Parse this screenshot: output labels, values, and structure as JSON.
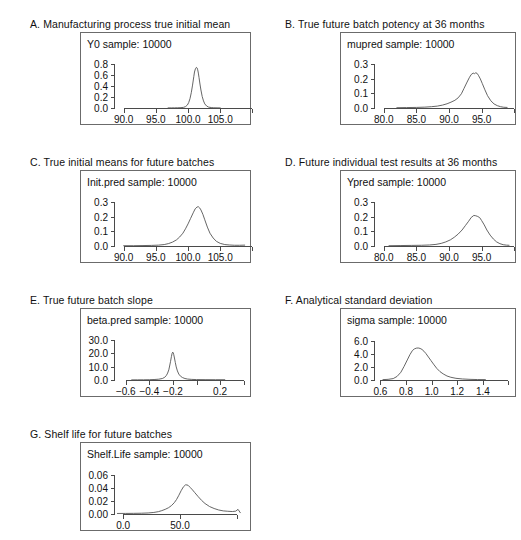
{
  "figure": {
    "background": "#ffffff",
    "line_color": "#555555",
    "frame_color": "#6b6b6b",
    "text_color": "#111111"
  },
  "panels": [
    {
      "id": "A",
      "title": "A. Manufacturing process true initial mean",
      "sample_label": "Y0 sample: 10000",
      "chart_data": {
        "type": "line",
        "title": "Y0 sample: 10000",
        "xlabel": "",
        "ylabel": "",
        "grid": false,
        "legend": "none",
        "xlim": [
          88.5,
          109.0
        ],
        "ylim": [
          0.0,
          0.88
        ],
        "xticks": [
          90.0,
          95.0,
          100.0,
          105.0
        ],
        "xticklabels": [
          "90.0",
          "95.0",
          "100.0",
          "105.0"
        ],
        "extra_xticks": [
          110.0
        ],
        "yticks": [
          0.0,
          0.2,
          0.4,
          0.6,
          0.8
        ],
        "yticklabels": [
          "0.0",
          "0.2",
          "0.4",
          "0.6",
          "0.8"
        ],
        "x": [
          96.9,
          97.4,
          97.9,
          98.4,
          98.9,
          99.3,
          99.6,
          99.9,
          100.1,
          100.3,
          100.5,
          100.7,
          100.9,
          101.0,
          101.15,
          101.3,
          101.4,
          101.5,
          101.6,
          101.7,
          101.85,
          102.0,
          102.2,
          102.4,
          102.6,
          102.9,
          103.2,
          103.6,
          104.0,
          104.5,
          105.0
        ],
        "y": [
          0.002,
          0.002,
          0.003,
          0.004,
          0.006,
          0.012,
          0.025,
          0.055,
          0.1,
          0.17,
          0.28,
          0.42,
          0.58,
          0.66,
          0.72,
          0.745,
          0.735,
          0.7,
          0.64,
          0.56,
          0.44,
          0.33,
          0.21,
          0.13,
          0.075,
          0.035,
          0.016,
          0.008,
          0.004,
          0.003,
          0.002
        ]
      }
    },
    {
      "id": "B",
      "title": "B. True future batch potency at 36 months",
      "sample_label": "mupred sample: 10000",
      "chart_data": {
        "type": "line",
        "title": "mupred sample: 10000",
        "xlabel": "",
        "ylabel": "",
        "grid": false,
        "legend": "none",
        "xlim": [
          78.5,
          99.5
        ],
        "ylim": [
          0.0,
          0.33
        ],
        "xticks": [
          80.0,
          85.0,
          90.0,
          95.0
        ],
        "xticklabels": [
          "80.0",
          "85.0",
          "90.0",
          "95.0"
        ],
        "extra_xticks": [
          100.0
        ],
        "yticks": [
          0.0,
          0.1,
          0.2,
          0.3
        ],
        "yticklabels": [
          "0.0",
          "0.1",
          "0.2",
          "0.3"
        ],
        "x": [
          82.0,
          83.5,
          85.0,
          86.3,
          87.3,
          88.2,
          89.0,
          89.7,
          90.3,
          90.9,
          91.4,
          91.9,
          92.3,
          92.7,
          93.1,
          93.4,
          93.7,
          93.9,
          94.1,
          94.3,
          94.5,
          94.8,
          95.1,
          95.5,
          95.9,
          96.4,
          96.9,
          97.4,
          97.9,
          98.4,
          98.9
        ],
        "y": [
          0.002,
          0.003,
          0.004,
          0.006,
          0.009,
          0.013,
          0.02,
          0.029,
          0.04,
          0.053,
          0.07,
          0.098,
          0.135,
          0.172,
          0.208,
          0.23,
          0.24,
          0.236,
          0.242,
          0.238,
          0.225,
          0.2,
          0.168,
          0.125,
          0.085,
          0.05,
          0.028,
          0.016,
          0.009,
          0.005,
          0.004
        ]
      }
    },
    {
      "id": "C",
      "title": "C. True initial means for future batches",
      "sample_label": "Init.pred sample: 10000",
      "chart_data": {
        "type": "line",
        "title": "Init.pred sample: 10000",
        "xlabel": "",
        "ylabel": "",
        "grid": false,
        "legend": "none",
        "xlim": [
          88.5,
          109.0
        ],
        "ylim": [
          0.0,
          0.33
        ],
        "xticks": [
          90.0,
          95.0,
          100.0,
          105.0
        ],
        "xticklabels": [
          "90.0",
          "95.0",
          "100.0",
          "105.0"
        ],
        "extra_xticks": [
          110.0
        ],
        "yticks": [
          0.0,
          0.1,
          0.2,
          0.3
        ],
        "yticklabels": [
          "0.0",
          "0.1",
          "0.2",
          "0.3"
        ],
        "x": [
          90.0,
          91.5,
          93.0,
          94.3,
          95.4,
          96.3,
          97.0,
          97.6,
          98.2,
          98.7,
          99.2,
          99.6,
          100.0,
          100.4,
          100.8,
          101.1,
          101.4,
          101.6,
          101.8,
          102.0,
          102.3,
          102.6,
          103.0,
          103.4,
          103.9,
          104.4,
          105.0,
          105.7,
          106.4,
          107.2,
          108.0,
          108.8
        ],
        "y": [
          0.002,
          0.002,
          0.003,
          0.004,
          0.006,
          0.01,
          0.017,
          0.027,
          0.042,
          0.062,
          0.088,
          0.118,
          0.152,
          0.19,
          0.228,
          0.255,
          0.268,
          0.27,
          0.262,
          0.248,
          0.218,
          0.18,
          0.13,
          0.088,
          0.055,
          0.032,
          0.018,
          0.01,
          0.007,
          0.005,
          0.005,
          0.006
        ]
      }
    },
    {
      "id": "D",
      "title": "D. Future individual test results at 36 months",
      "sample_label": "Ypred sample: 10000",
      "chart_data": {
        "type": "line",
        "title": "Ypred sample: 10000",
        "xlabel": "",
        "ylabel": "",
        "grid": false,
        "legend": "none",
        "xlim": [
          78.5,
          99.5
        ],
        "ylim": [
          0.0,
          0.33
        ],
        "xticks": [
          80.0,
          85.0,
          90.0,
          95.0
        ],
        "xticklabels": [
          "80.0",
          "85.0",
          "90.0",
          "95.0"
        ],
        "extra_xticks": [
          100.0
        ],
        "yticks": [
          0.0,
          0.1,
          0.2,
          0.3
        ],
        "yticklabels": [
          "0.0",
          "0.1",
          "0.2",
          "0.3"
        ],
        "x": [
          80.8,
          82.5,
          84.2,
          85.8,
          87.0,
          88.0,
          88.8,
          89.5,
          90.2,
          90.8,
          91.4,
          92.0,
          92.5,
          93.0,
          93.4,
          93.8,
          94.1,
          94.4,
          94.7,
          95.0,
          95.4,
          95.8,
          96.3,
          96.8,
          97.3,
          97.8,
          98.3,
          98.8,
          99.2
        ],
        "y": [
          0.002,
          0.003,
          0.004,
          0.005,
          0.007,
          0.011,
          0.018,
          0.028,
          0.042,
          0.06,
          0.082,
          0.11,
          0.14,
          0.17,
          0.196,
          0.21,
          0.208,
          0.203,
          0.195,
          0.175,
          0.145,
          0.11,
          0.075,
          0.048,
          0.028,
          0.016,
          0.009,
          0.006,
          0.005
        ]
      }
    },
    {
      "id": "E",
      "title": "E. True future batch slope",
      "sample_label": "beta.pred sample: 10000",
      "chart_data": {
        "type": "line",
        "title": "beta.pred sample: 10000",
        "xlabel": "",
        "ylabel": "",
        "grid": false,
        "legend": "none",
        "xlim": [
          -0.7,
          0.42
        ],
        "ylim": [
          0.0,
          33.0
        ],
        "xticks": [
          -0.6,
          -0.4,
          -0.2,
          0.2
        ],
        "xticklabels": [
          "−0.6",
          "−0.4",
          "−0.2",
          "0.2"
        ],
        "extra_xticks": [
          0.0,
          0.4
        ],
        "yticks": [
          0.0,
          10.0,
          20.0,
          30.0
        ],
        "yticklabels": [
          "0.0",
          "10.0",
          "20.0",
          "30.0"
        ],
        "x": [
          -0.55,
          -0.5,
          -0.45,
          -0.4,
          -0.36,
          -0.32,
          -0.29,
          -0.27,
          -0.255,
          -0.245,
          -0.235,
          -0.228,
          -0.22,
          -0.213,
          -0.207,
          -0.202,
          -0.198,
          -0.193,
          -0.187,
          -0.18,
          -0.172,
          -0.162,
          -0.15,
          -0.135,
          -0.118,
          -0.098,
          -0.075,
          -0.04,
          0.0,
          0.08,
          0.16,
          0.24
        ],
        "y": [
          0.1,
          0.12,
          0.15,
          0.22,
          0.35,
          0.6,
          1.1,
          2.0,
          3.5,
          5.2,
          7.6,
          10.5,
          14.0,
          17.5,
          20.0,
          20.9,
          20.5,
          19.0,
          16.5,
          13.2,
          9.8,
          6.8,
          4.4,
          2.8,
          1.8,
          1.1,
          0.7,
          0.45,
          0.32,
          0.25,
          0.22,
          0.2
        ]
      }
    },
    {
      "id": "F",
      "title": "F. Analytical standard deviation",
      "sample_label": "sigma sample: 10000",
      "chart_data": {
        "type": "line",
        "title": "sigma sample: 10000",
        "xlabel": "",
        "ylabel": "",
        "grid": false,
        "legend": "none",
        "xlim": [
          0.55,
          1.62
        ],
        "ylim": [
          0.0,
          6.8
        ],
        "xticks": [
          0.6,
          0.8,
          1.0,
          1.2,
          1.4
        ],
        "xticklabels": [
          "0.6",
          "0.8",
          "1.0",
          "1.2",
          "1.4"
        ],
        "extra_xticks": [
          1.6
        ],
        "yticks": [
          0.0,
          2.0,
          4.0,
          6.0
        ],
        "yticklabels": [
          "0.0",
          "2.0",
          "4.0",
          "6.0"
        ],
        "x": [
          0.62,
          0.66,
          0.7,
          0.73,
          0.76,
          0.785,
          0.81,
          0.83,
          0.85,
          0.865,
          0.88,
          0.895,
          0.91,
          0.925,
          0.94,
          0.955,
          0.975,
          0.995,
          1.015,
          1.04,
          1.065,
          1.09,
          1.12,
          1.15,
          1.19,
          1.24,
          1.3,
          1.36,
          1.42
        ],
        "y": [
          0.06,
          0.1,
          0.22,
          0.55,
          1.2,
          2.1,
          3.1,
          3.9,
          4.55,
          4.8,
          4.92,
          4.95,
          4.88,
          4.72,
          4.45,
          4.1,
          3.55,
          3.0,
          2.45,
          1.8,
          1.3,
          0.95,
          0.62,
          0.42,
          0.26,
          0.16,
          0.1,
          0.07,
          0.06
        ]
      }
    },
    {
      "id": "G",
      "title": "G. Shelf life for future batches",
      "sample_label": "Shelf.Life sample: 10000",
      "chart_data": {
        "type": "line",
        "title": "Shelf.Life sample: 10000",
        "xlabel": "",
        "ylabel": "",
        "grid": false,
        "legend": "none",
        "xlim": [
          -8.0,
          108.0
        ],
        "ylim": [
          0.0,
          0.068
        ],
        "xticks": [
          0.0,
          50.0
        ],
        "xticklabels": [
          "0.0",
          "50.0"
        ],
        "extra_xticks": [
          100.0
        ],
        "yticks": [
          0.0,
          0.02,
          0.04,
          0.06
        ],
        "yticklabels": [
          "0.00",
          "0.02",
          "0.04",
          "0.06"
        ],
        "x": [
          -5,
          2,
          9,
          16,
          22,
          27,
          31,
          34,
          37,
          40,
          42.5,
          45,
          47,
          49,
          51,
          53,
          55,
          57,
          59,
          61,
          63,
          66,
          69,
          72,
          76,
          80,
          84,
          88,
          92,
          96,
          99,
          101,
          103
        ],
        "y": [
          0.0008,
          0.0009,
          0.001,
          0.0012,
          0.0016,
          0.0024,
          0.0036,
          0.0052,
          0.0072,
          0.0098,
          0.013,
          0.0175,
          0.0225,
          0.029,
          0.036,
          0.042,
          0.0452,
          0.0445,
          0.041,
          0.0372,
          0.033,
          0.0268,
          0.021,
          0.0162,
          0.0115,
          0.0085,
          0.0062,
          0.0048,
          0.0042,
          0.0038,
          0.0044,
          0.0072,
          0.002
        ]
      }
    }
  ]
}
